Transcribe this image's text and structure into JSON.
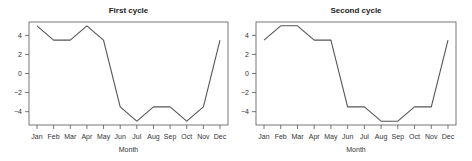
{
  "chart_data": [
    {
      "type": "line",
      "title": "First cycle",
      "xlabel": "Month",
      "ylabel": "",
      "categories": [
        "Jan",
        "Feb",
        "Mar",
        "Apr",
        "May",
        "Jun",
        "Jul",
        "Aug",
        "Sep",
        "Oct",
        "Nov",
        "Dec"
      ],
      "values": [
        5,
        3.5,
        3.5,
        5,
        3.5,
        -3.5,
        -5,
        -3.5,
        -3.5,
        -5,
        -3.5,
        3.5
      ],
      "yticks": [
        4,
        2,
        0,
        -2,
        -4
      ],
      "ylim": [
        -5.4,
        5.4
      ],
      "grid": false,
      "legend": null
    },
    {
      "type": "line",
      "title": "Second cycle",
      "xlabel": "Month",
      "ylabel": "",
      "categories": [
        "Jan",
        "Feb",
        "Mar",
        "Apr",
        "May",
        "Jun",
        "Jul",
        "Aug",
        "Sep",
        "Oct",
        "Nov",
        "Dec"
      ],
      "values": [
        3.5,
        5,
        5,
        3.5,
        3.5,
        -3.5,
        -3.5,
        -5,
        -5,
        -3.5,
        -3.5,
        3.5
      ],
      "yticks": [
        4,
        2,
        0,
        -2,
        -4
      ],
      "ylim": [
        -5.4,
        5.4
      ],
      "grid": false,
      "legend": null
    }
  ],
  "colors": {
    "line": "#555555",
    "frame": "#555555",
    "text": "#333333"
  }
}
